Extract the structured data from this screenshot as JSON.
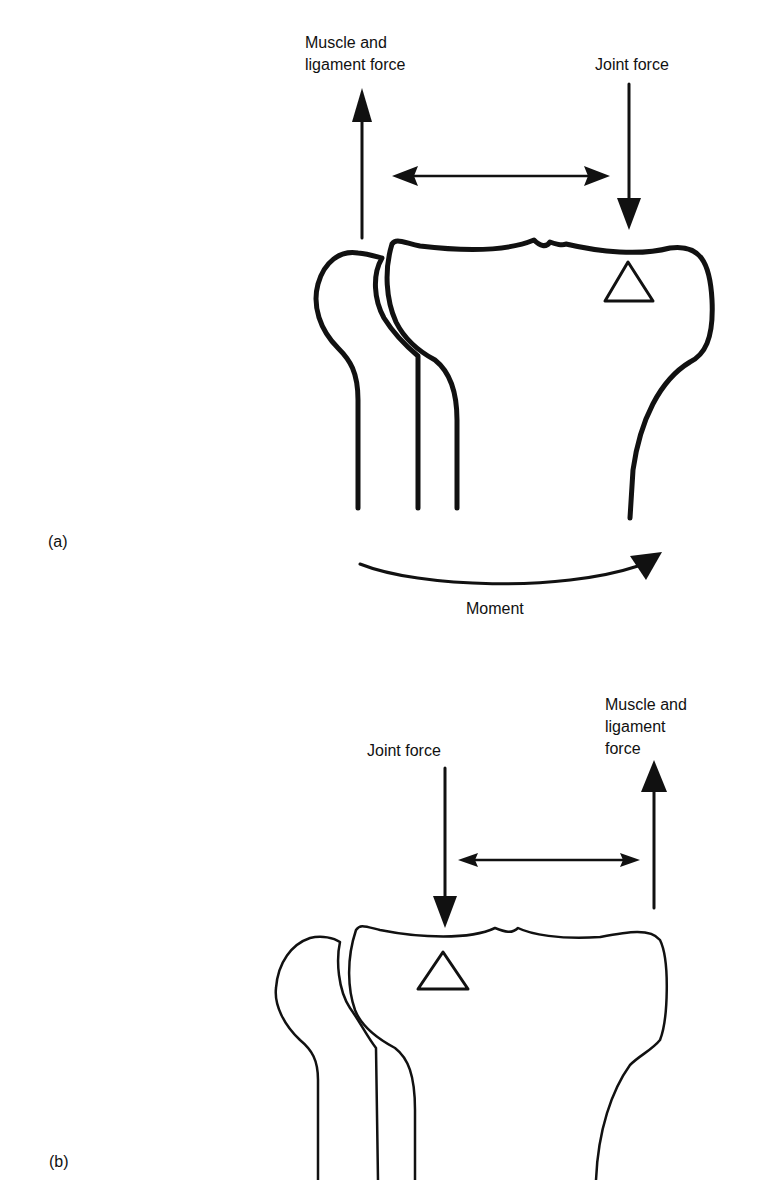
{
  "figure": {
    "panel_a": {
      "label": "(a)",
      "muscle_label_line1": "Muscle and",
      "muscle_label_line2": "ligament force",
      "joint_label": "Joint force",
      "moment_label": "Moment"
    },
    "panel_b": {
      "label": "(b)",
      "joint_label": "Joint force",
      "muscle_label_line1": "Muscle and",
      "muscle_label_line2": "ligament",
      "muscle_label_line3": "force"
    },
    "colors": {
      "ink": "#111111",
      "background": "#ffffff"
    }
  }
}
